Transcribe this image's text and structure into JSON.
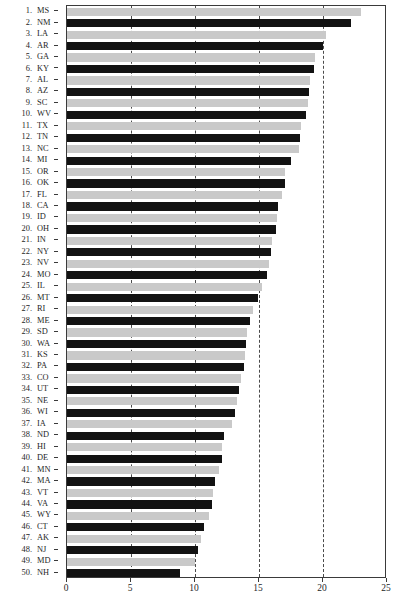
{
  "chart_data": {
    "type": "bar",
    "orientation": "horizontal",
    "title": "",
    "xlabel": "",
    "ylabel": "",
    "xlim": [
      0,
      25
    ],
    "xticks": [
      0,
      5,
      10,
      15,
      20,
      25
    ],
    "xtick_labels": [
      "0",
      "5",
      "10",
      "15",
      "20",
      "25"
    ],
    "gridlines": [
      5,
      10,
      15,
      20
    ],
    "grid": true,
    "grid_style": "dashed",
    "legend": "none",
    "bar_colors": {
      "odd": "#c9c9c9",
      "even": "#121212"
    },
    "categories": [
      "MS",
      "NM",
      "LA",
      "AR",
      "GA",
      "KY",
      "AL",
      "AZ",
      "SC",
      "WV",
      "TX",
      "TN",
      "NC",
      "MI",
      "OR",
      "OK",
      "FL",
      "CA",
      "ID",
      "OH",
      "IN",
      "NY",
      "NV",
      "MO",
      "IL",
      "MT",
      "RI",
      "ME",
      "SD",
      "WA",
      "KS",
      "PA",
      "CO",
      "UT",
      "NE",
      "WI",
      "IA",
      "ND",
      "HI",
      "DE",
      "MN",
      "MA",
      "VT",
      "VA",
      "WY",
      "CT",
      "AK",
      "NJ",
      "MD",
      "NH"
    ],
    "ranks": [
      1,
      2,
      3,
      4,
      5,
      6,
      7,
      8,
      9,
      10,
      11,
      12,
      13,
      14,
      15,
      16,
      17,
      18,
      19,
      20,
      21,
      22,
      23,
      24,
      25,
      26,
      27,
      28,
      29,
      30,
      31,
      32,
      33,
      34,
      35,
      36,
      37,
      38,
      39,
      40,
      41,
      42,
      43,
      44,
      45,
      46,
      47,
      48,
      49,
      50
    ],
    "values": [
      23.0,
      22.2,
      20.2,
      20.0,
      19.4,
      19.3,
      19.0,
      18.9,
      18.8,
      18.7,
      18.3,
      18.2,
      18.1,
      17.5,
      17.0,
      17.0,
      16.8,
      16.5,
      16.4,
      16.3,
      16.0,
      15.9,
      15.8,
      15.6,
      15.2,
      14.9,
      14.5,
      14.3,
      14.1,
      14.0,
      13.9,
      13.8,
      13.6,
      13.4,
      13.3,
      13.1,
      12.9,
      12.3,
      12.1,
      12.1,
      11.9,
      11.6,
      11.4,
      11.3,
      11.1,
      10.7,
      10.5,
      10.2,
      10.0,
      8.8
    ]
  },
  "axis": {
    "x_tick_0": "0",
    "x_tick_5": "5",
    "x_tick_10": "10",
    "x_tick_15": "15",
    "x_tick_20": "20",
    "x_tick_25": "25"
  }
}
